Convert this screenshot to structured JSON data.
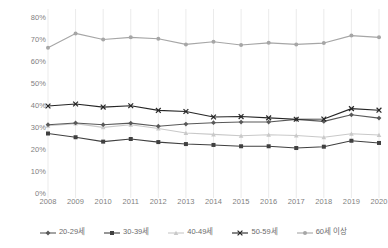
{
  "chart_data": {
    "type": "line",
    "title": "",
    "xlabel": "",
    "ylabel": "",
    "categories": [
      "2008",
      "2009",
      "2010",
      "2011",
      "2012",
      "2013",
      "2014",
      "2015",
      "2016",
      "2017",
      "2018",
      "2019",
      "2020"
    ],
    "ylim": [
      0,
      80
    ],
    "ytick_labels": [
      "0%",
      "10%",
      "20%",
      "30%",
      "40%",
      "50%",
      "60%",
      "70%",
      "80%"
    ],
    "ytick_values": [
      0,
      10,
      20,
      30,
      40,
      50,
      60,
      70,
      80
    ],
    "grid": "vertical",
    "legend_position": "bottom",
    "series": [
      {
        "name": "20-29세",
        "color": "#595959",
        "marker": "diamond",
        "values": [
          31.5,
          32.3,
          31.5,
          32.2,
          30.8,
          31.8,
          32.4,
          32.7,
          32.7,
          33.9,
          33.0,
          36.0,
          34.5
        ]
      },
      {
        "name": "30-39세",
        "color": "#404040",
        "marker": "square",
        "values": [
          27.5,
          25.8,
          23.8,
          25.0,
          23.6,
          22.7,
          22.3,
          21.7,
          21.7,
          20.9,
          21.5,
          24.2,
          23.2
        ]
      },
      {
        "name": "40-49세",
        "color": "#c9c9c9",
        "marker": "triangle",
        "values": [
          31.0,
          32.0,
          30.3,
          31.5,
          29.8,
          27.7,
          27.1,
          26.5,
          26.9,
          26.6,
          25.8,
          27.4,
          26.8
        ]
      },
      {
        "name": "50-59세",
        "color": "#262626",
        "marker": "cross",
        "values": [
          40.0,
          40.9,
          39.5,
          40.1,
          38.0,
          37.5,
          35.0,
          35.2,
          34.6,
          34.0,
          34.1,
          38.8,
          38.1
        ]
      },
      {
        "name": "60세 이상",
        "color": "#a6a6a6",
        "marker": "circle",
        "values": [
          66.5,
          73.0,
          70.2,
          71.2,
          70.6,
          68.0,
          69.2,
          67.7,
          68.7,
          68.0,
          68.6,
          72.0,
          71.2
        ]
      }
    ]
  }
}
